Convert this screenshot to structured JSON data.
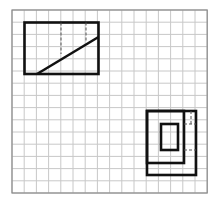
{
  "grid": {
    "left": 12,
    "top": 10,
    "cols": 16,
    "rows": 15,
    "cell": 12.2,
    "line_color": "#c8c8c8",
    "border_color": "#8a8a8a"
  },
  "figures": {
    "top_left": {
      "rect": [
        24.5,
        22.5,
        98.5,
        74
      ],
      "diagonal": [
        37,
        74,
        98.5,
        37
      ],
      "dashed": [
        [
          61,
          22.5,
          61,
          54
        ],
        [
          86,
          22.5,
          86,
          42
        ]
      ]
    },
    "bottom_right": {
      "outer": [
        147,
        111,
        196,
        175
      ],
      "middle": [
        147,
        111,
        184,
        163
      ],
      "inner": [
        161,
        124,
        178,
        150
      ],
      "dashed": [
        [
          184,
          124,
          196,
          124
        ],
        [
          184,
          150,
          196,
          150
        ],
        [
          191,
          111,
          191,
          124
        ]
      ]
    },
    "stroke_color": "#111111"
  }
}
